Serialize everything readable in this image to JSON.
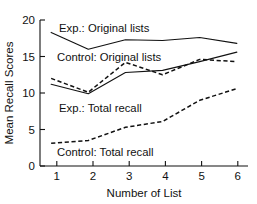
{
  "chart_data": {
    "type": "line",
    "title": "",
    "xlabel": "Number of List",
    "ylabel": "Mean Recall Scores",
    "x": [
      1,
      2,
      3,
      4,
      5,
      6
    ],
    "xticklabels": [
      "1",
      "2",
      "3",
      "4",
      "5",
      "6"
    ],
    "yticklabels": [
      "0",
      "5",
      "10",
      "15",
      "20"
    ],
    "yticks": [
      0,
      5,
      10,
      15,
      20
    ],
    "xlim": [
      0.7,
      6.3
    ],
    "ylim": [
      0,
      20
    ],
    "grid": false,
    "legend_position": "inline-annotations",
    "series": [
      {
        "name": "Exp.: Original lists",
        "style": "solid",
        "color": "#111111",
        "values": [
          18.3,
          16.0,
          17.3,
          17.2,
          17.6,
          16.8
        ]
      },
      {
        "name": "Control: Original lists",
        "style": "solid",
        "color": "#111111",
        "values": [
          11.2,
          9.9,
          12.8,
          13.1,
          14.3,
          15.6
        ]
      },
      {
        "name": "Exp.: Total recall",
        "style": "dashed",
        "color": "#111111",
        "values": [
          12.0,
          10.1,
          14.2,
          12.5,
          14.6,
          14.3
        ]
      },
      {
        "name": "Control: Total recall",
        "style": "dashed",
        "color": "#111111",
        "values": [
          3.1,
          3.5,
          5.3,
          6.1,
          9.0,
          10.6
        ]
      }
    ],
    "annotations": [
      {
        "text": "Exp.: Original lists",
        "x": 1.35,
        "y": 19.2
      },
      {
        "text": "Control: Original lists",
        "x": 1.3,
        "y": 15.1
      },
      {
        "text": "Exp.: Total recall",
        "x": 1.35,
        "y": 8.2
      },
      {
        "text": "Control: Total recall",
        "x": 1.3,
        "y": 2.1
      }
    ]
  }
}
